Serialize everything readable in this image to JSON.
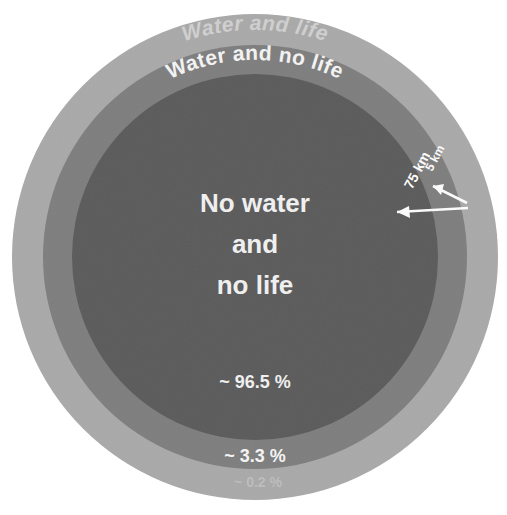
{
  "figure": {
    "background_color": "#ffffff",
    "center_x": 255,
    "center_y": 257
  },
  "chart_data": {
    "type": "pie",
    "title": "",
    "subtitle": "",
    "xlabel": "",
    "ylabel": "",
    "legend_position": "none",
    "grid": false,
    "layout": "concentric-rings",
    "categories": [
      "No water and no life",
      "Water and no life",
      "Water and life"
    ],
    "values": [
      96.5,
      3.3,
      0.2
    ],
    "value_labels": [
      "~ 96.5 %",
      "~ 3.3 %",
      "~ 0.2 %"
    ],
    "series": [
      {
        "name": "Volume share",
        "values": [
          96.5,
          3.3,
          0.2
        ]
      }
    ],
    "annotations": [
      "5 km",
      "75 km"
    ],
    "rings": [
      {
        "id": "outer",
        "label": "Water and life",
        "percent_label": "~ 0.2 %",
        "value": 0.2,
        "thickness_label": "5 km",
        "color": "#a9a9a9",
        "radius_outer": 243,
        "radius_inner": 212
      },
      {
        "id": "middle",
        "label": "Water and no life",
        "percent_label": "~ 3.3 %",
        "value": 3.3,
        "thickness_label": "75 km",
        "color": "#7e7e7e",
        "radius_outer": 212,
        "radius_inner": 183
      },
      {
        "id": "core",
        "label_lines": [
          "No water",
          "and",
          "no life"
        ],
        "percent_label": "~ 96.5 %",
        "value": 96.5,
        "thickness_label": "",
        "color": "#5b5b5b",
        "radius_outer": 183,
        "radius_inner": 0
      }
    ]
  },
  "labels": {
    "outer_ring_text": "Water and life",
    "middle_ring_text": "Water and no life",
    "core_line_1": "No water",
    "core_line_2": "and",
    "core_line_3": "no life",
    "core_percent": "~ 96.5 %",
    "middle_percent": "~ 3.3 %",
    "outer_percent": "~ 0.2 %",
    "dimension_outer": "5 km",
    "dimension_middle": "75 km"
  },
  "colors": {
    "ring_outer": "#a9a9a9",
    "ring_middle": "#7e7e7e",
    "ring_core": "#5b5b5b",
    "text_light": "#efefef",
    "text_faint": "#cfcfcf",
    "arrow": "#fbfbfb",
    "background": "#ffffff"
  }
}
